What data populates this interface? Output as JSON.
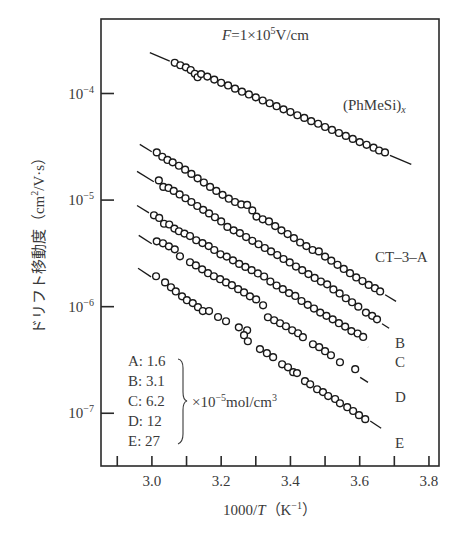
{
  "chart_data": {
    "type": "scatter",
    "title": "",
    "xlabel": "1000/T (K⁻¹)",
    "xlabel_parts": {
      "pre": "1000/",
      "italic": "T",
      "post": "（K",
      "sup": "−1",
      "close": "）"
    },
    "ylabel": "ドリフト移動度 (cm²/V·s)",
    "ylabel_parts": {
      "pre": "ドリフト移動度（cm",
      "sup": "2",
      "post": "/V·s）"
    },
    "xlim": [
      2.853,
      3.829
    ],
    "ylim": [
      3.2e-08,
      0.0005
    ],
    "yscale": "log",
    "grid": false,
    "x_ticks": [
      2.9,
      3.0,
      3.1,
      3.2,
      3.3,
      3.4,
      3.5,
      3.6,
      3.7,
      3.8
    ],
    "x_tick_labels": [
      {
        "value": 3.0,
        "label": "3.0"
      },
      {
        "value": 3.2,
        "label": "3.2"
      },
      {
        "value": 3.4,
        "label": "3.4"
      },
      {
        "value": 3.6,
        "label": "3.6"
      },
      {
        "value": 3.8,
        "label": "3.8"
      }
    ],
    "y_ticks": [
      {
        "value": 0.0001,
        "base": "10",
        "exp": "−4"
      },
      {
        "value": 1e-05,
        "base": "10",
        "exp": "−5"
      },
      {
        "value": 1e-06,
        "base": "10",
        "exp": "−6"
      },
      {
        "value": 1e-07,
        "base": "10",
        "exp": "−7"
      }
    ],
    "annotations": {
      "field": {
        "pre": "F",
        "mid": "=1×10",
        "sup": "5",
        "post": "V/cm"
      },
      "polymer_label": {
        "pre": "(PhMeSi)",
        "sub": "x"
      },
      "dopant_label": "CT–3–A"
    },
    "legend": {
      "placement": "bottom-left",
      "entries": [
        "A: 1.6",
        "B: 3.1",
        "C: 6.2",
        "D: 12",
        "E: 27"
      ],
      "unit": {
        "pre": "×10",
        "sup": "−5",
        "post": "mol/cm",
        "sup2": "3"
      }
    },
    "series": [
      {
        "name": "(PhMeSi)x",
        "label": "",
        "fit": [
          [
            2.994,
            0.000242
          ],
          [
            3.749,
            2.16e-05
          ]
        ],
        "points": [
          [
            3.066,
            0.000194
          ],
          [
            3.082,
            0.000184
          ],
          [
            3.098,
            0.000176
          ],
          [
            3.112,
            0.000166
          ],
          [
            3.124,
            0.000153
          ],
          [
            3.132,
            0.000142
          ],
          [
            3.142,
            0.000152
          ],
          [
            3.16,
            0.000144
          ],
          [
            3.18,
            0.000135
          ],
          [
            3.2,
            0.000126
          ],
          [
            3.22,
            0.000119
          ],
          [
            3.24,
            0.000111
          ],
          [
            3.26,
            0.000104
          ],
          [
            3.28,
            9.8e-05
          ],
          [
            3.3,
            9.2e-05
          ],
          [
            3.32,
            8.6e-05
          ],
          [
            3.34,
            8.1e-05
          ],
          [
            3.36,
            7.6e-05
          ],
          [
            3.38,
            7.1e-05
          ],
          [
            3.4,
            6.7e-05
          ],
          [
            3.42,
            6.25e-05
          ],
          [
            3.44,
            5.9e-05
          ],
          [
            3.46,
            5.5e-05
          ],
          [
            3.48,
            5.2e-05
          ],
          [
            3.5,
            4.85e-05
          ],
          [
            3.52,
            4.55e-05
          ],
          [
            3.54,
            4.26e-05
          ],
          [
            3.56,
            4e-05
          ],
          [
            3.58,
            3.75e-05
          ],
          [
            3.6,
            3.5e-05
          ],
          [
            3.62,
            3.3e-05
          ],
          [
            3.64,
            3.1e-05
          ],
          [
            3.656,
            2.92e-05
          ],
          [
            3.673,
            2.8e-05
          ]
        ]
      },
      {
        "name": "A",
        "label": "",
        "fit": [
          [
            2.965,
            3.33e-05
          ],
          [
            3.705,
            1.12e-06
          ]
        ],
        "points": [
          [
            3.014,
            2.8e-05
          ],
          [
            3.03,
            2.55e-05
          ],
          [
            3.045,
            2.38e-05
          ],
          [
            3.06,
            2.26e-05
          ],
          [
            3.078,
            2.1e-05
          ],
          [
            3.096,
            1.93e-05
          ],
          [
            3.114,
            1.76e-05
          ],
          [
            3.132,
            1.6e-05
          ],
          [
            3.15,
            1.46e-05
          ],
          [
            3.168,
            1.33e-05
          ],
          [
            3.186,
            1.22e-05
          ],
          [
            3.204,
            1.12e-05
          ],
          [
            3.222,
            1.03e-05
          ],
          [
            3.24,
            9.6e-06
          ],
          [
            3.258,
            9.1e-06
          ],
          [
            3.275,
            9e-06
          ],
          [
            3.29,
            8e-06
          ],
          [
            3.302,
            7e-06
          ],
          [
            3.32,
            6.6e-06
          ],
          [
            3.338,
            6.3e-06
          ],
          [
            3.356,
            5.7e-06
          ],
          [
            3.374,
            5.2e-06
          ],
          [
            3.392,
            4.8e-06
          ],
          [
            3.41,
            4.4e-06
          ],
          [
            3.428,
            4e-06
          ],
          [
            3.446,
            3.7e-06
          ],
          [
            3.464,
            3.4e-06
          ],
          [
            3.482,
            3.3e-06
          ],
          [
            3.5,
            2.95e-06
          ],
          [
            3.518,
            2.7e-06
          ],
          [
            3.536,
            2.47e-06
          ],
          [
            3.554,
            2.26e-06
          ],
          [
            3.572,
            2.06e-06
          ],
          [
            3.59,
            1.88e-06
          ],
          [
            3.608,
            1.74e-06
          ],
          [
            3.626,
            1.6e-06
          ],
          [
            3.644,
            1.49e-06
          ],
          [
            3.659,
            1.39e-06
          ]
        ]
      },
      {
        "name": "B",
        "label": "B",
        "fit": [
          [
            2.957,
            1.86e-05
          ],
          [
            3.685,
            6.28e-07
          ]
        ],
        "points": [
          [
            3.02,
            1.53e-05
          ],
          [
            3.033,
            1.33e-05
          ],
          [
            3.048,
            1.3e-05
          ],
          [
            3.063,
            1.22e-05
          ],
          [
            3.08,
            1.13e-05
          ],
          [
            3.097,
            1.04e-05
          ],
          [
            3.114,
            9.6e-06
          ],
          [
            3.131,
            8.8e-06
          ],
          [
            3.148,
            8.1e-06
          ],
          [
            3.165,
            7.5e-06
          ],
          [
            3.182,
            6.9e-06
          ],
          [
            3.2,
            6.3e-06
          ],
          [
            3.218,
            5.6e-06
          ],
          [
            3.236,
            5.2e-06
          ],
          [
            3.254,
            4.9e-06
          ],
          [
            3.272,
            4.5e-06
          ],
          [
            3.29,
            4.15e-06
          ],
          [
            3.308,
            3.85e-06
          ],
          [
            3.326,
            3.55e-06
          ],
          [
            3.344,
            3.3e-06
          ],
          [
            3.362,
            3.05e-06
          ],
          [
            3.38,
            2.8e-06
          ],
          [
            3.398,
            2.6e-06
          ],
          [
            3.416,
            2.38e-06
          ],
          [
            3.434,
            2.2e-06
          ],
          [
            3.452,
            2.02e-06
          ],
          [
            3.47,
            1.86e-06
          ],
          [
            3.488,
            1.72e-06
          ],
          [
            3.506,
            1.62e-06
          ],
          [
            3.524,
            1.45e-06
          ],
          [
            3.542,
            1.33e-06
          ],
          [
            3.56,
            1.2e-06
          ],
          [
            3.578,
            1.1e-06
          ],
          [
            3.596,
            1e-06
          ],
          [
            3.618,
            8.8e-07
          ],
          [
            3.636,
            8.2e-07
          ],
          [
            3.65,
            7.6e-07
          ]
        ]
      },
      {
        "name": "C",
        "label": "C",
        "fit": [
          [
            2.957,
            8.9e-06
          ],
          [
            3.624,
            4.17e-07
          ]
        ],
        "points": [
          [
            3.006,
            7.2e-06
          ],
          [
            3.021,
            6.8e-06
          ],
          [
            3.035,
            6e-06
          ],
          [
            3.05,
            5.9e-06
          ],
          [
            3.065,
            5.4e-06
          ],
          [
            3.078,
            5.1e-06
          ],
          [
            3.094,
            4.85e-06
          ],
          [
            3.11,
            4.6e-06
          ],
          [
            3.128,
            4.2e-06
          ],
          [
            3.146,
            3.95e-06
          ],
          [
            3.164,
            3.7e-06
          ],
          [
            3.18,
            3.4e-06
          ],
          [
            3.198,
            3.1e-06
          ],
          [
            3.216,
            2.95e-06
          ],
          [
            3.234,
            2.72e-06
          ],
          [
            3.252,
            2.52e-06
          ],
          [
            3.27,
            2.36e-06
          ],
          [
            3.288,
            2.2e-06
          ],
          [
            3.306,
            2.05e-06
          ],
          [
            3.324,
            1.92e-06
          ],
          [
            3.342,
            1.72e-06
          ],
          [
            3.36,
            1.58e-06
          ],
          [
            3.378,
            1.46e-06
          ],
          [
            3.396,
            1.34e-06
          ],
          [
            3.414,
            1.26e-06
          ],
          [
            3.432,
            1.13e-06
          ],
          [
            3.45,
            1.04e-06
          ],
          [
            3.468,
            9.6e-07
          ],
          [
            3.486,
            8.8e-07
          ],
          [
            3.504,
            8.2e-07
          ],
          [
            3.522,
            7.6e-07
          ],
          [
            3.54,
            7e-07
          ],
          [
            3.558,
            6.5e-07
          ],
          [
            3.576,
            5.9e-07
          ],
          [
            3.594,
            5.6e-07
          ],
          [
            3.61,
            5.2e-07
          ]
        ]
      },
      {
        "name": "D",
        "label": "D",
        "fit": [
          [
            2.962,
            4.67e-06
          ],
          [
            3.624,
            1.95e-07
          ]
        ],
        "points": [
          [
            3.014,
            4.1e-06
          ],
          [
            3.032,
            3.93e-06
          ],
          [
            3.049,
            3.68e-06
          ],
          [
            3.066,
            3.45e-06
          ],
          [
            3.081,
            2.97e-06
          ],
          [
            3.11,
            2.61e-06
          ],
          [
            3.127,
            2.44e-06
          ],
          [
            3.145,
            2.24e-06
          ],
          [
            3.162,
            2.06e-06
          ],
          [
            3.179,
            1.93e-06
          ],
          [
            3.197,
            1.81e-06
          ],
          [
            3.214,
            1.69e-06
          ],
          [
            3.231,
            1.59e-06
          ],
          [
            3.249,
            1.46e-06
          ],
          [
            3.266,
            1.36e-06
          ],
          [
            3.283,
            1.25e-06
          ],
          [
            3.301,
            1.17e-06
          ],
          [
            3.321,
            1.03e-06
          ],
          [
            3.335,
            7.96e-07
          ],
          [
            3.353,
            7.46e-07
          ],
          [
            3.37,
            6.99e-07
          ],
          [
            3.387,
            6.55e-07
          ],
          [
            3.405,
            6e-07
          ],
          [
            3.422,
            5.63e-07
          ],
          [
            3.436,
            5.17e-07
          ],
          [
            3.465,
            4.44e-07
          ],
          [
            3.483,
            4.17e-07
          ],
          [
            3.5,
            3.82e-07
          ],
          [
            3.517,
            3.5e-07
          ],
          [
            3.543,
            3.01e-07
          ],
          [
            3.587,
            2.59e-07
          ]
        ]
      },
      {
        "name": "E",
        "label": "E",
        "fit": [
          [
            2.96,
            2.29e-06
          ],
          [
            3.662,
            7.24e-08
          ]
        ],
        "points": [
          [
            3.012,
            1.93e-06
          ],
          [
            3.038,
            1.69e-06
          ],
          [
            3.055,
            1.52e-06
          ],
          [
            3.069,
            1.39e-06
          ],
          [
            3.087,
            1.25e-06
          ],
          [
            3.101,
            1.15e-06
          ],
          [
            3.118,
            1.08e-06
          ],
          [
            3.133,
            9.9e-07
          ],
          [
            3.147,
            9.1e-07
          ],
          [
            3.165,
            9.1e-07
          ],
          [
            3.191,
            8e-07
          ],
          [
            3.214,
            7.3e-07
          ],
          [
            3.251,
            6.4e-07
          ],
          [
            3.275,
            6e-07
          ],
          [
            3.266,
            5.4e-07
          ],
          [
            3.277,
            4.74e-07
          ],
          [
            3.312,
            4e-07
          ],
          [
            3.332,
            3.66e-07
          ],
          [
            3.35,
            3.36e-07
          ],
          [
            3.376,
            2.88e-07
          ],
          [
            3.393,
            2.7e-07
          ],
          [
            3.408,
            2.43e-07
          ],
          [
            3.419,
            2.38e-07
          ],
          [
            3.442,
            2e-07
          ],
          [
            3.457,
            1.87e-07
          ],
          [
            3.477,
            1.68e-07
          ],
          [
            3.494,
            1.58e-07
          ],
          [
            3.509,
            1.45e-07
          ],
          [
            3.529,
            1.36e-07
          ],
          [
            3.543,
            1.24e-07
          ],
          [
            3.564,
            1.14e-07
          ],
          [
            3.581,
            1.05e-07
          ],
          [
            3.598,
            9.6e-08
          ],
          [
            3.616,
            8.8e-08
          ]
        ]
      }
    ]
  }
}
